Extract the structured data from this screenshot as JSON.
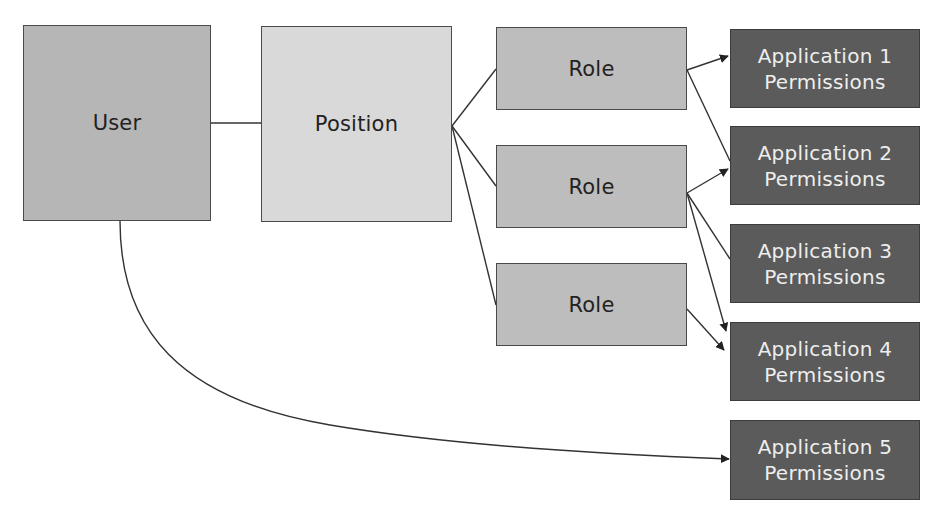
{
  "diagram": {
    "colors": {
      "user_fill": "#b6b6b6",
      "position_fill": "#d9d9d9",
      "role_fill": "#bdbdbd",
      "app_fill": "#5b5b5b",
      "app_text": "#eeeeee",
      "node_text": "#222222",
      "line": "#333333"
    },
    "nodes": {
      "user": {
        "label": "User"
      },
      "position": {
        "label": "Position"
      },
      "roles": [
        {
          "label": "Role"
        },
        {
          "label": "Role"
        },
        {
          "label": "Role"
        }
      ],
      "applications": [
        {
          "line1": "Application 1",
          "line2": "Permissions"
        },
        {
          "line1": "Application 2",
          "line2": "Permissions"
        },
        {
          "line1": "Application 3",
          "line2": "Permissions"
        },
        {
          "line1": "Application 4",
          "line2": "Permissions"
        },
        {
          "line1": "Application 5",
          "line2": "Permissions"
        }
      ]
    },
    "edges": [
      {
        "from": "User",
        "to": "Position",
        "arrow": false
      },
      {
        "from": "Position",
        "to": "Role 1",
        "arrow": false
      },
      {
        "from": "Position",
        "to": "Role 2",
        "arrow": false
      },
      {
        "from": "Position",
        "to": "Role 3",
        "arrow": false
      },
      {
        "from": "Role 1",
        "to": "Application 1 Permissions",
        "arrow": true
      },
      {
        "from": "Role 1",
        "to": "Application 2 Permissions",
        "arrow": false
      },
      {
        "from": "Role 2",
        "to": "Application 2 Permissions",
        "arrow": true
      },
      {
        "from": "Role 2",
        "to": "Application 3 Permissions",
        "arrow": false
      },
      {
        "from": "Role 2",
        "to": "Application 4 Permissions",
        "arrow": true
      },
      {
        "from": "Role 3",
        "to": "Application 4 Permissions",
        "arrow": true
      },
      {
        "from": "User",
        "to": "Application 5 Permissions",
        "arrow": true
      }
    ]
  }
}
